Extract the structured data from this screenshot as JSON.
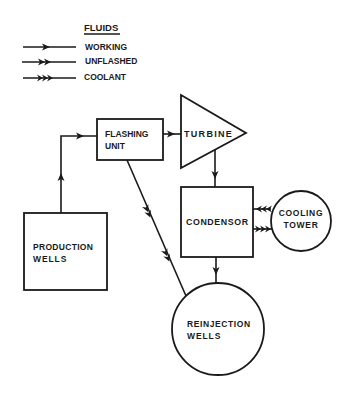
{
  "legend": {
    "title": "FLUIDS",
    "items": [
      {
        "label": "WORKING",
        "arrows": 1
      },
      {
        "label": "UNFLASHED",
        "arrows": 2
      },
      {
        "label": "COOLANT",
        "arrows": 3
      }
    ]
  },
  "nodes": {
    "flashing_unit": {
      "line1": "FLASHING",
      "line2": "UNIT",
      "shape": "rectangle"
    },
    "turbine": {
      "label": "TURBINE",
      "shape": "triangle"
    },
    "condensor": {
      "label": "CONDENSOR",
      "shape": "rectangle"
    },
    "cooling_tower": {
      "line1": "COOLING",
      "line2": "TOWER",
      "shape": "circle"
    },
    "production_wells": {
      "line1": "PRODUCTION",
      "line2": "WELLS",
      "shape": "rectangle"
    },
    "reinjection_wells": {
      "line1": "REINJECTION",
      "line2": "WELLS",
      "shape": "circle"
    }
  },
  "edges": [
    {
      "from": "production_wells",
      "to": "flashing_unit",
      "fluid": "WORKING"
    },
    {
      "from": "flashing_unit",
      "to": "turbine",
      "fluid": "WORKING"
    },
    {
      "from": "flashing_unit",
      "to": "reinjection_wells",
      "fluid": "UNFLASHED"
    },
    {
      "from": "turbine",
      "to": "condensor",
      "fluid": "WORKING"
    },
    {
      "from": "cooling_tower",
      "to": "condensor",
      "fluid": "COOLANT"
    },
    {
      "from": "condensor",
      "to": "cooling_tower",
      "fluid": "COOLANT"
    },
    {
      "from": "condensor",
      "to": "reinjection_wells",
      "fluid": "WORKING"
    }
  ]
}
